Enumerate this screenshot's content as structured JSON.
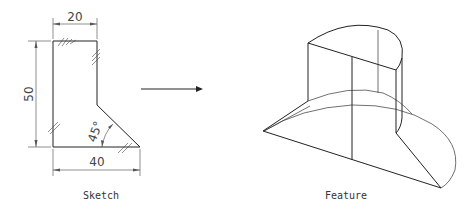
{
  "sketch": {
    "caption": "Sketch",
    "dimensions": {
      "top_width": "20",
      "height": "50",
      "bottom_width": "40",
      "angle": "45°"
    }
  },
  "arrow": {
    "direction": "right"
  },
  "feature": {
    "caption": "Feature"
  }
}
